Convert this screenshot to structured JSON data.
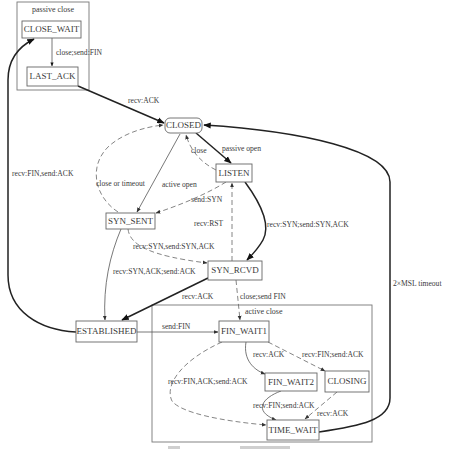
{
  "figure": {
    "groups": {
      "passive_close": "passive close",
      "active_close": "active close"
    },
    "states": {
      "close_wait": "CLOSE_WAIT",
      "last_ack": "LAST_ACK",
      "closed": "CLOSED",
      "listen": "LISTEN",
      "syn_sent": "SYN_SENT",
      "syn_rcvd": "SYN_RCVD",
      "established": "ESTABLISHED",
      "fin_wait1": "FIN_WAIT1",
      "fin_wait2": "FIN_WAIT2",
      "closing": "CLOSING",
      "time_wait": "TIME_WAIT"
    },
    "transitions": [
      {
        "from": "CLOSE_WAIT",
        "to": "LAST_ACK",
        "label": "close;send:FIN",
        "style": "solid"
      },
      {
        "from": "LAST_ACK",
        "to": "CLOSED",
        "label": "recv:ACK",
        "style": "thick"
      },
      {
        "from": "ESTABLISHED",
        "to": "CLOSE_WAIT",
        "label": "recv:FIN,send:ACK",
        "style": "thick"
      },
      {
        "from": "CLOSED",
        "to": "LISTEN",
        "label": "passive open",
        "style": "thick"
      },
      {
        "from": "LISTEN",
        "to": "CLOSED",
        "label": "close",
        "style": "dashed"
      },
      {
        "from": "CLOSED",
        "to": "SYN_SENT",
        "label": "active open",
        "style": "solid"
      },
      {
        "from": "SYN_SENT",
        "to": "CLOSED",
        "label": "close or timeout",
        "style": "dashed"
      },
      {
        "from": "LISTEN",
        "to": "SYN_SENT",
        "label": "send:SYN",
        "style": "dashed"
      },
      {
        "from": "SYN_RCVD",
        "to": "LISTEN",
        "label": "recv:RST",
        "style": "dashed"
      },
      {
        "from": "LISTEN",
        "to": "SYN_RCVD",
        "label": "recv:SYN;send:SYN,ACK",
        "style": "thick"
      },
      {
        "from": "SYN_SENT",
        "to": "SYN_RCVD",
        "label": "recv:SYN,send:SYN,ACK",
        "style": "dashed"
      },
      {
        "from": "SYN_SENT",
        "to": "ESTABLISHED",
        "label": "recv:SYN,ACK;send:ACK",
        "style": "solid"
      },
      {
        "from": "SYN_RCVD",
        "to": "ESTABLISHED",
        "label": "recv:ACK",
        "style": "thick"
      },
      {
        "from": "SYN_RCVD",
        "to": "FIN_WAIT1",
        "label": "close;send FIN",
        "style": "dashed"
      },
      {
        "from": "ESTABLISHED",
        "to": "FIN_WAIT1",
        "label": "send:FIN",
        "style": "solid"
      },
      {
        "from": "FIN_WAIT1",
        "to": "FIN_WAIT2",
        "label": "recv:ACK",
        "style": "solid"
      },
      {
        "from": "FIN_WAIT1",
        "to": "CLOSING",
        "label": "recv:FIN;send:ACK",
        "style": "dashed"
      },
      {
        "from": "FIN_WAIT1",
        "to": "TIME_WAIT",
        "label": "recv:FIN,ACK;send:ACK",
        "style": "dashed"
      },
      {
        "from": "FIN_WAIT2",
        "to": "TIME_WAIT",
        "label": "recv:FIN;send:ACK",
        "style": "solid"
      },
      {
        "from": "CLOSING",
        "to": "TIME_WAIT",
        "label": "recv:ACK",
        "style": "dashed"
      },
      {
        "from": "TIME_WAIT",
        "to": "CLOSED",
        "label": "2×MSL timeout",
        "style": "thick"
      }
    ]
  },
  "colors": {
    "background": "#ffffff",
    "text": "#3a3a3a",
    "box_border": "#666666",
    "thick_edge": "#222222",
    "thin_edge": "#555555"
  }
}
